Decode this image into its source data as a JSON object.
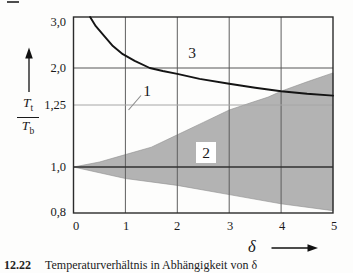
{
  "figure": {
    "y_axis": {
      "fraction": {
        "num_base": "T",
        "num_sub": "t",
        "den_base": "T",
        "den_sub": "b"
      },
      "ticks": [
        {
          "label": "3,0",
          "value": 3.0
        },
        {
          "label": "2,0",
          "value": 2.0
        },
        {
          "label": "1,25",
          "value": 1.25
        },
        {
          "label": "1,0",
          "value": 1.0
        },
        {
          "label": "0,8",
          "value": 0.8
        }
      ]
    },
    "x_axis": {
      "label": "δ",
      "ticks": [
        {
          "label": "0",
          "value": 0
        },
        {
          "label": "1",
          "value": 1
        },
        {
          "label": "2",
          "value": 2
        },
        {
          "label": "3",
          "value": 3
        },
        {
          "label": "4",
          "value": 4
        },
        {
          "label": "5",
          "value": 5
        }
      ]
    },
    "labels": {
      "curve": "1",
      "band": "2",
      "upper_region": "3"
    },
    "caption": {
      "number": "12.22",
      "text": "Temperaturverhältnis in Abhängigkeit von δ"
    }
  },
  "chart_data": {
    "type": "area",
    "title": "",
    "xlabel": "δ",
    "ylabel": "Tt/Tb",
    "x_range": [
      0,
      5
    ],
    "y_ticks": [
      0.8,
      1.0,
      1.25,
      2.0,
      3.0
    ],
    "y_scale_note": "non-uniform printed axis; tick spacing as in original figure",
    "grid": true,
    "colors": {
      "band_fill": "#b3b3b3",
      "curve": "#141414",
      "grid_dark": "#565656",
      "grid_light": "#a6a6a6",
      "frame": "#2b2b2b"
    },
    "series": [
      {
        "name": "curve-1-limit",
        "type": "line",
        "points": [
          [
            0.32,
            3.0
          ],
          [
            0.43,
            2.82
          ],
          [
            0.59,
            2.63
          ],
          [
            0.76,
            2.43
          ],
          [
            0.95,
            2.27
          ],
          [
            1.18,
            2.14
          ],
          [
            1.47,
            2.0
          ],
          [
            1.72,
            1.94
          ],
          [
            2.0,
            1.88
          ],
          [
            2.43,
            1.78
          ],
          [
            3.0,
            1.68
          ],
          [
            3.5,
            1.6
          ],
          [
            4.0,
            1.53
          ],
          [
            4.5,
            1.48
          ],
          [
            5.0,
            1.44
          ]
        ]
      },
      {
        "name": "band-2-upper",
        "type": "area-boundary",
        "points": [
          [
            0,
            1.0
          ],
          [
            0.5,
            1.02
          ],
          [
            1.0,
            1.05
          ],
          [
            1.5,
            1.08
          ],
          [
            2.0,
            1.13
          ],
          [
            2.5,
            1.18
          ],
          [
            3.0,
            1.23
          ],
          [
            3.4,
            1.29
          ],
          [
            3.75,
            1.41
          ],
          [
            4.0,
            1.53
          ],
          [
            4.5,
            1.72
          ],
          [
            5.0,
            1.9
          ]
        ]
      },
      {
        "name": "band-2-lower",
        "type": "area-boundary",
        "points": [
          [
            0,
            1.0
          ],
          [
            1.0,
            0.95
          ],
          [
            2.0,
            0.92
          ],
          [
            3.0,
            0.88
          ],
          [
            4.0,
            0.84
          ],
          [
            5.0,
            0.81
          ]
        ]
      }
    ],
    "region_labels": [
      {
        "text": "1",
        "x": 1.4,
        "y": 1.62,
        "note": "curve label with leader line"
      },
      {
        "text": "2",
        "x": 2.6,
        "y": 1.07,
        "note": "inside shaded band, on white box"
      },
      {
        "text": "3",
        "x": 2.3,
        "y": 2.35,
        "note": "region above curve"
      }
    ]
  }
}
